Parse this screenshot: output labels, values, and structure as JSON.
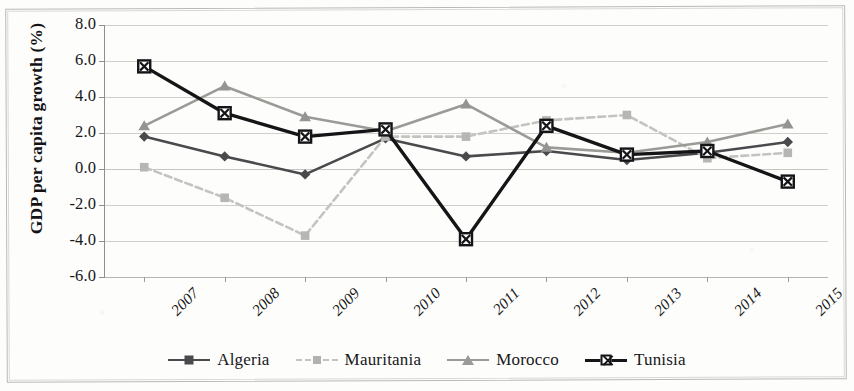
{
  "chart_data": {
    "type": "line",
    "title": "",
    "subtitle": "",
    "xlabel": "",
    "ylabel": "GDP per capita growth (%)",
    "categories": [
      "2007",
      "2008",
      "2009",
      "2010",
      "2011",
      "2012",
      "2013",
      "2014",
      "2015"
    ],
    "ylim": [
      -6.0,
      8.0
    ],
    "ytick_step": 2.0,
    "yticks": [
      "8.0",
      "6.0",
      "4.0",
      "2.0",
      "0.0",
      "-2.0",
      "-4.0",
      "-6.0"
    ],
    "ytick_values": [
      8.0,
      6.0,
      4.0,
      2.0,
      0.0,
      -2.0,
      -4.0,
      -6.0
    ],
    "grid": true,
    "grid_axis": "y",
    "legend_position": "bottom",
    "xtick_rotation": -45,
    "series": [
      {
        "name": "Algeria",
        "values": [
          1.8,
          0.7,
          -0.3,
          1.7,
          0.7,
          1.0,
          0.5,
          0.9,
          1.5
        ],
        "color": "#4a4a4d",
        "marker": "diamond",
        "dash": "solid"
      },
      {
        "name": "Mauritania",
        "values": [
          0.1,
          -1.6,
          -3.7,
          1.8,
          1.8,
          2.7,
          3.0,
          0.6,
          0.9
        ],
        "color": "#c3c3bf",
        "marker": "square",
        "dash": "dashed"
      },
      {
        "name": "Morocco",
        "values": [
          2.4,
          4.6,
          2.9,
          2.1,
          3.6,
          1.2,
          0.9,
          1.5,
          2.5
        ],
        "color": "#9a9a96",
        "marker": "triangle",
        "dash": "solid"
      },
      {
        "name": "Tunisia",
        "values": [
          5.7,
          3.1,
          1.8,
          2.2,
          -3.9,
          2.4,
          0.8,
          1.0,
          -0.7
        ],
        "color": "#151518",
        "marker": "box-x",
        "dash": "solid"
      }
    ]
  }
}
